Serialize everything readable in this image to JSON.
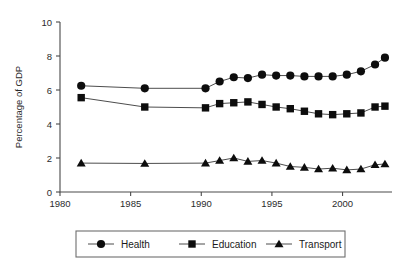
{
  "chart_data": {
    "type": "line",
    "title": "",
    "xlabel": "",
    "ylabel": "Percentage of GDP",
    "xlim": [
      1980,
      2003.5
    ],
    "ylim": [
      0,
      10
    ],
    "grid": false,
    "legend_position": "bottom",
    "x_ticks": [
      1980,
      1985,
      1990,
      1995,
      2000
    ],
    "x_tick_labels": [
      "1980",
      "1985",
      "1990",
      "1995",
      "2000"
    ],
    "y_ticks": [
      0,
      2,
      4,
      6,
      8,
      10
    ],
    "y_tick_labels": [
      "0",
      "2",
      "4",
      "6",
      "8",
      "10"
    ],
    "series": [
      {
        "name": "Health",
        "marker": "circle",
        "x": [
          1981.5,
          1986,
          1990.3,
          1991.3,
          1992.3,
          1993.3,
          1994.3,
          1995.3,
          1996.3,
          1997.3,
          1998.3,
          1999.3,
          2000.3,
          2001.3,
          2002.3,
          2003
        ],
        "values": [
          6.25,
          6.1,
          6.1,
          6.5,
          6.75,
          6.7,
          6.9,
          6.85,
          6.85,
          6.8,
          6.8,
          6.8,
          6.9,
          7.1,
          7.5,
          7.9
        ]
      },
      {
        "name": "Education",
        "marker": "square",
        "x": [
          1981.5,
          1986,
          1990.3,
          1991.3,
          1992.3,
          1993.3,
          1994.3,
          1995.3,
          1996.3,
          1997.3,
          1998.3,
          1999.3,
          2000.3,
          2001.3,
          2002.3,
          2003
        ],
        "values": [
          5.55,
          5.0,
          4.95,
          5.2,
          5.25,
          5.3,
          5.15,
          5.0,
          4.9,
          4.75,
          4.6,
          4.55,
          4.6,
          4.65,
          5.0,
          5.05
        ]
      },
      {
        "name": "Transport",
        "marker": "triangle",
        "x": [
          1981.5,
          1986,
          1990.3,
          1991.3,
          1992.3,
          1993.3,
          1994.3,
          1995.3,
          1996.3,
          1997.3,
          1998.3,
          1999.3,
          2000.3,
          2001.3,
          2002.3,
          2003
        ],
        "values": [
          1.7,
          1.68,
          1.7,
          1.85,
          2.0,
          1.8,
          1.85,
          1.7,
          1.5,
          1.45,
          1.35,
          1.4,
          1.3,
          1.35,
          1.6,
          1.65
        ]
      }
    ]
  },
  "legend": {
    "items": [
      {
        "label": "Health",
        "marker": "circle"
      },
      {
        "label": "Education",
        "marker": "square"
      },
      {
        "label": "Transport",
        "marker": "triangle"
      }
    ]
  }
}
